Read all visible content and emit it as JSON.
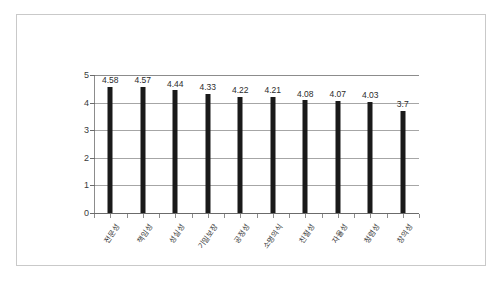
{
  "chart_data": {
    "type": "bar",
    "title": "",
    "subtitle": "",
    "xlabel": "",
    "ylabel": "",
    "ylim": [
      0,
      5
    ],
    "ytick_step": 1,
    "yticks": [
      "0",
      "1",
      "2",
      "3",
      "4",
      "5"
    ],
    "grid": "horizontal",
    "legend": "none",
    "bar_color": "#1a1a1a",
    "gridline_color": "#a6a6a6",
    "axis_color": "#6b6b6b",
    "categories": [
      "전문성",
      "책임성",
      "성실성",
      "기밀보장",
      "공정성",
      "소명의식",
      "친절성",
      "자율성",
      "청렴성",
      "창의성"
    ],
    "values": [
      4.58,
      4.57,
      4.44,
      4.33,
      4.22,
      4.21,
      4.08,
      4.07,
      4.03,
      3.7
    ],
    "data_labels": [
      "4.58",
      "4.57",
      "4.44",
      "4.33",
      "4.22",
      "4.21",
      "4.08",
      "4.07",
      "4.03",
      "3.7"
    ]
  }
}
